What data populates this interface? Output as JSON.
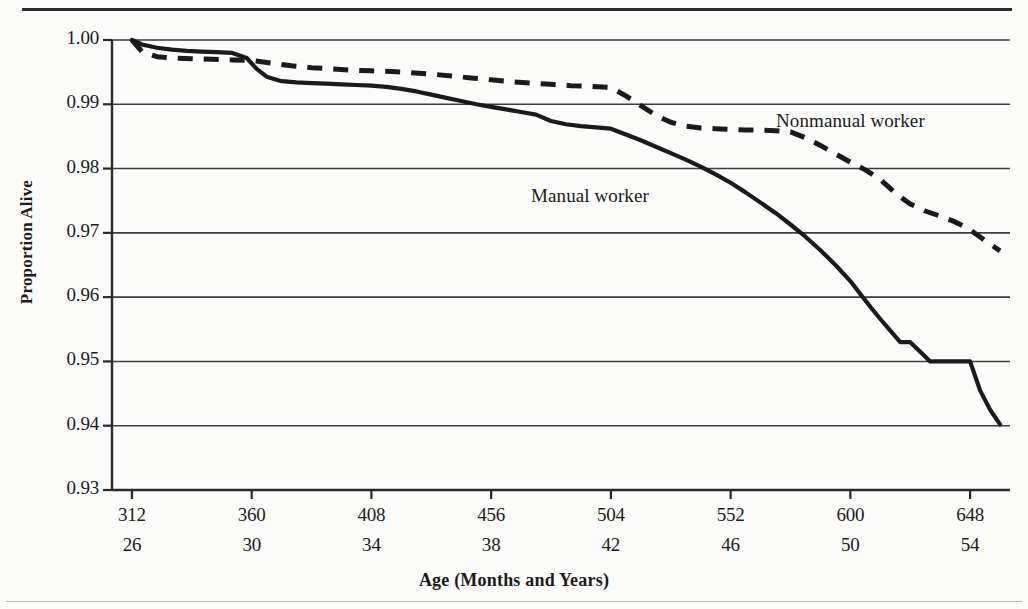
{
  "chart_data": {
    "type": "line",
    "title": "",
    "subtitle": "",
    "xlabel": "Age (Months and Years)",
    "ylabel": "Proportion Alive",
    "grid": true,
    "legend_position": "inline-annotation",
    "xlim": [
      304,
      664
    ],
    "ylim": [
      0.93,
      1.0
    ],
    "x_tick_months": [
      312,
      360,
      408,
      456,
      504,
      552,
      600,
      648
    ],
    "x_tick_years": [
      26,
      30,
      34,
      38,
      42,
      46,
      50,
      54
    ],
    "x_tick_labels_months": [
      "312",
      "360",
      "408",
      "456",
      "504",
      "552",
      "600",
      "648"
    ],
    "x_tick_labels_years": [
      "26",
      "30",
      "34",
      "38",
      "42",
      "46",
      "50",
      "54"
    ],
    "y_ticks": [
      0.93,
      0.94,
      0.95,
      0.96,
      0.97,
      0.98,
      0.99,
      1.0
    ],
    "y_tick_labels": [
      "0.93",
      "0.94",
      "0.95",
      "0.96",
      "0.97",
      "0.98",
      "0.99",
      "1.00"
    ],
    "series": [
      {
        "name": "Manual worker",
        "style": "solid",
        "color": "#1a1a1a",
        "annotation": "Manual worker",
        "x": [
          312,
          316,
          322,
          328,
          334,
          340,
          346,
          352,
          358,
          362,
          366,
          372,
          378,
          384,
          390,
          396,
          402,
          408,
          414,
          420,
          426,
          432,
          438,
          444,
          450,
          456,
          462,
          468,
          474,
          480,
          486,
          492,
          498,
          504,
          510,
          516,
          522,
          528,
          534,
          540,
          546,
          552,
          558,
          564,
          570,
          576,
          582,
          588,
          594,
          600,
          604,
          608,
          612,
          616,
          620,
          624,
          628,
          632,
          636,
          640,
          644,
          648,
          652,
          656,
          660
        ],
        "y": [
          1.0,
          0.9993,
          0.9988,
          0.9985,
          0.9983,
          0.9982,
          0.9981,
          0.998,
          0.9972,
          0.9955,
          0.9943,
          0.9936,
          0.9934,
          0.9933,
          0.9932,
          0.9931,
          0.993,
          0.9929,
          0.9927,
          0.9924,
          0.992,
          0.9915,
          0.991,
          0.9905,
          0.99,
          0.9896,
          0.9892,
          0.9888,
          0.9884,
          0.9874,
          0.9869,
          0.9866,
          0.9864,
          0.9862,
          0.9853,
          0.9844,
          0.9834,
          0.9824,
          0.9814,
          0.9803,
          0.9791,
          0.9778,
          0.9763,
          0.9747,
          0.9731,
          0.9713,
          0.9694,
          0.9673,
          0.965,
          0.9625,
          0.9605,
          0.9585,
          0.9566,
          0.9548,
          0.953,
          0.953,
          0.9515,
          0.95,
          0.95,
          0.95,
          0.95,
          0.95,
          0.9455,
          0.9425,
          0.9402
        ]
      },
      {
        "name": "Nonmanual worker",
        "style": "dashed",
        "color": "#1a1a1a",
        "annotation": "Nonmanual worker",
        "x": [
          312,
          316,
          322,
          328,
          336,
          344,
          352,
          360,
          368,
          376,
          384,
          392,
          400,
          408,
          416,
          424,
          432,
          440,
          448,
          456,
          464,
          472,
          480,
          488,
          496,
          504,
          510,
          516,
          522,
          528,
          534,
          540,
          546,
          552,
          558,
          564,
          570,
          576,
          582,
          588,
          594,
          600,
          606,
          612,
          618,
          624,
          630,
          636,
          642,
          648,
          654,
          660
        ],
        "y": [
          1.0,
          0.9982,
          0.9974,
          0.9972,
          0.9971,
          0.997,
          0.9969,
          0.9968,
          0.9964,
          0.996,
          0.9957,
          0.9955,
          0.9953,
          0.9952,
          0.9951,
          0.9949,
          0.9947,
          0.9944,
          0.9941,
          0.9938,
          0.9935,
          0.9933,
          0.9931,
          0.9929,
          0.9928,
          0.9926,
          0.9913,
          0.9898,
          0.9883,
          0.9872,
          0.9866,
          0.9863,
          0.9862,
          0.9861,
          0.986,
          0.986,
          0.9859,
          0.9857,
          0.9848,
          0.9836,
          0.9823,
          0.981,
          0.9798,
          0.9783,
          0.9762,
          0.9745,
          0.9734,
          0.9726,
          0.9717,
          0.9705,
          0.9688,
          0.9672
        ]
      }
    ]
  },
  "axis": {
    "y_title": "Proportion Alive",
    "x_title": "Age (Months and Years)"
  },
  "annotations": {
    "nonmanual": "Nonmanual worker",
    "manual": "Manual worker"
  },
  "style": {
    "line_color": "#1a1a1a",
    "grid_color": "#3c3c3c",
    "background": "#fbfbfa",
    "rule_color": "#2a2a2a"
  }
}
